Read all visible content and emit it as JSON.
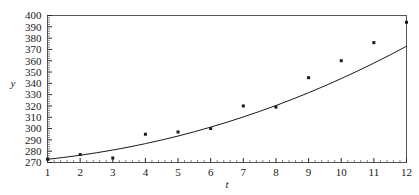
{
  "chart_data": {
    "type": "scatter",
    "title": "",
    "xlabel": "t",
    "ylabel": "y",
    "grid": false,
    "legend": null,
    "xlim": [
      1,
      12
    ],
    "ylim": [
      270,
      400
    ],
    "xticks": [
      1,
      2,
      3,
      4,
      5,
      6,
      7,
      8,
      9,
      10,
      11,
      12
    ],
    "xtick_labels": [
      "1",
      "2",
      "3",
      "4",
      "5",
      "6",
      "7",
      "8",
      "9",
      "10",
      "11",
      "12"
    ],
    "yticks": [
      270,
      280,
      290,
      300,
      310,
      320,
      330,
      340,
      350,
      360,
      370,
      380,
      390,
      400
    ],
    "ytick_labels": [
      "270",
      "280",
      "290",
      "300",
      "310",
      "320",
      "330",
      "340",
      "350",
      "360",
      "370",
      "380",
      "390",
      "400"
    ],
    "x": [
      1,
      2,
      3,
      4,
      5,
      6,
      7,
      8,
      9,
      10,
      11,
      12
    ],
    "values": [
      273,
      277,
      274,
      295,
      297,
      300,
      320,
      319,
      345,
      360,
      376,
      394
    ],
    "series": [
      {
        "name": "data points",
        "kind": "scatter",
        "marker": "square",
        "color": "#1a1a1a",
        "x": [
          1,
          2,
          3,
          4,
          5,
          6,
          7,
          8,
          9,
          10,
          11,
          12
        ],
        "values": [
          273,
          277,
          274,
          295,
          297,
          300,
          320,
          319,
          345,
          360,
          376,
          394
        ]
      },
      {
        "name": "fitted curve",
        "kind": "line",
        "color": "#1a1a1a",
        "x": [
          1,
          1.5,
          2,
          2.5,
          3,
          3.5,
          4,
          4.5,
          5,
          5.5,
          6,
          6.5,
          7,
          7.5,
          8,
          8.5,
          9,
          9.5,
          10,
          10.5,
          11,
          11.5,
          12
        ],
        "values": [
          272.8,
          274.5,
          276.4,
          278.6,
          281.0,
          283.7,
          286.7,
          289.9,
          293.4,
          297.2,
          301.3,
          305.6,
          310.3,
          315.2,
          320.4,
          325.9,
          331.7,
          337.8,
          344.2,
          350.9,
          357.9,
          365.2,
          372.8
        ]
      }
    ],
    "minor_ticks": {
      "x_per_interval": 5,
      "y_per_interval": 5
    },
    "frame": {
      "box": true,
      "color": "#555555"
    }
  }
}
